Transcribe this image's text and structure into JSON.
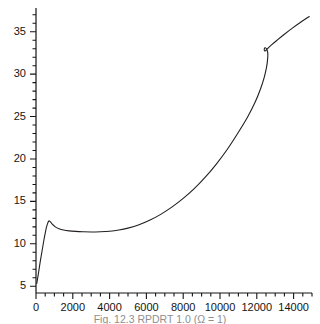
{
  "figure": {
    "caption": "Fig. 12.3  RPDRT 1.0 (Ω = 1)"
  },
  "chart_data": {
    "type": "line",
    "title": "",
    "xlabel": "",
    "ylabel": "",
    "xlim": [
      0,
      15000
    ],
    "ylim": [
      4.2,
      37.8
    ],
    "grid": false,
    "legend": null,
    "axis_style": "L-shaped spine, ticks outward, minor ticks unlabeled",
    "xticks": [
      0,
      2000,
      4000,
      6000,
      8000,
      10000,
      12000,
      14000
    ],
    "xtick_labels": [
      "0",
      "2000",
      "4000",
      "6000",
      "8000",
      "10000",
      "12000",
      "14000"
    ],
    "xminor_step": 500,
    "yticks": [
      5,
      10,
      15,
      20,
      25,
      30,
      35
    ],
    "ytick_labels": [
      "5",
      "10",
      "15",
      "20",
      "25",
      "30",
      "35"
    ],
    "yminor_step": 1,
    "line_color": "#231f20",
    "line_width": 1.1,
    "series": [
      {
        "name": "curve",
        "x": [
          40,
          120,
          230,
          340,
          430,
          510,
          580,
          640,
          690,
          730,
          800,
          900,
          1050,
          1250,
          1500,
          1800,
          2150,
          2550,
          3000,
          3500,
          4000,
          4500,
          5000,
          5600,
          6200,
          6800,
          7400,
          8000,
          8600,
          9200,
          9800,
          10400,
          11000,
          11500,
          11900,
          12200,
          12400,
          12520,
          12580,
          12600,
          12560,
          12480,
          12420,
          12410,
          12470,
          12600,
          12800,
          13100,
          13500,
          13950,
          14400,
          14850
        ],
        "y": [
          5.3,
          6.35,
          7.9,
          9.3,
          10.45,
          11.35,
          12.05,
          12.45,
          12.68,
          12.7,
          12.55,
          12.28,
          12.0,
          11.78,
          11.62,
          11.52,
          11.46,
          11.42,
          11.4,
          11.42,
          11.48,
          11.62,
          11.85,
          12.25,
          12.8,
          13.5,
          14.35,
          15.35,
          16.5,
          17.85,
          19.4,
          21.15,
          23.15,
          24.95,
          26.65,
          28.25,
          29.6,
          30.7,
          31.6,
          32.35,
          32.85,
          33.1,
          33.05,
          32.8,
          32.75,
          33.05,
          33.45,
          34.0,
          34.7,
          35.45,
          36.15,
          36.8
        ]
      }
    ],
    "annotations": [
      {
        "kind": "local-maximum",
        "x": 730,
        "y": 12.7,
        "note": "early sharp peak"
      },
      {
        "kind": "local-minimum",
        "x": 3000,
        "y": 11.4,
        "note": "plateau trough"
      },
      {
        "kind": "cusp-loop",
        "x": 12500,
        "y": 33.0,
        "note": "small hysteresis loop near top"
      },
      {
        "kind": "endpoint",
        "x": 14850,
        "y": 36.8,
        "note": "right end of curve"
      },
      {
        "kind": "endpoint",
        "x": 40,
        "y": 5.3,
        "note": "left start of curve"
      }
    ]
  }
}
